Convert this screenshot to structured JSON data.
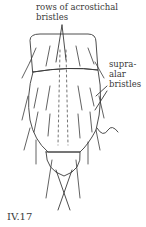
{
  "figure": {
    "id_label": "IV.17",
    "labels": {
      "acrostichal_line1": "rows of acrostichal",
      "acrostichal_line2": "bristles",
      "supra_line1": "supra-",
      "supra_line2": "alar",
      "supra_line3": "bristles"
    },
    "colors": {
      "ink": "#3a3a3a",
      "background": "#ffffff"
    }
  }
}
